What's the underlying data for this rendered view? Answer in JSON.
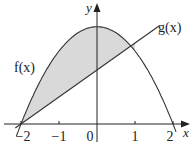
{
  "chart_data": {
    "type": "line",
    "title": "",
    "xlabel": "x",
    "ylabel": "y",
    "xlim": [
      -2.2,
      2.4
    ],
    "ylim": [
      -0.3,
      3.2
    ],
    "grid": false,
    "x_ticks": [
      -2,
      -1,
      0,
      1,
      2
    ],
    "x_tick_labels": [
      "−2",
      "−1",
      "0",
      "1",
      "2"
    ],
    "series": [
      {
        "name": "f(x)",
        "kind": "parabola (downward)",
        "x": [
          -2.1,
          -2,
          -1.5,
          -1,
          -0.5,
          0,
          0.5,
          1,
          1.5,
          2,
          2.1
        ],
        "y": [
          -0.26,
          0,
          1.12,
          1.92,
          2.4,
          2.56,
          2.4,
          1.92,
          1.12,
          0,
          -0.26
        ]
      },
      {
        "name": "g(x)",
        "kind": "line",
        "x": [
          -2.15,
          -2,
          -1,
          0,
          1,
          1.65
        ],
        "y": [
          -0.11,
          0,
          0.71,
          1.42,
          2.13,
          2.6
        ]
      }
    ],
    "shaded_region": {
      "description": "region between f(x) (above) and g(x) (below) from x=-2 to intersection x≈1",
      "x_from": -2,
      "x_to": 1,
      "color": "#d9d9d9"
    },
    "annotations": [
      {
        "text": "f(x)",
        "near": "left of curve f"
      },
      {
        "text": "g(x)",
        "near": "upper right end of line g"
      }
    ]
  },
  "labels": {
    "f": "f(x)",
    "g": "g(x)",
    "x_axis": "x",
    "y_axis": "y",
    "ticks": [
      "−2",
      "−1",
      "0",
      "1",
      "2"
    ]
  },
  "colors": {
    "curve": "#333333",
    "axis": "#222222",
    "shade": "#d9d9d9",
    "background": "#ffffff"
  }
}
